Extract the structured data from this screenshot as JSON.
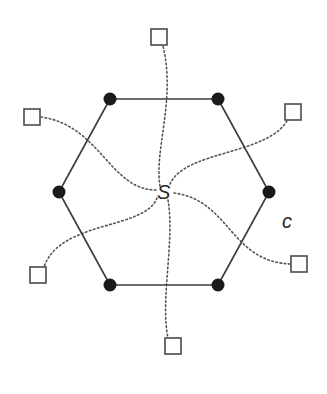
{
  "diagram": {
    "type": "hexagon-with-center-spokes",
    "center_label": "S",
    "region_label": "c",
    "center": {
      "x": 164,
      "y": 192
    },
    "colors": {
      "edge": "#3a3a3a",
      "vertex": "#1a1a1a",
      "terminal_stroke": "#4a4a4a",
      "spoke": "#555555",
      "background": "#ffffff"
    },
    "vertices": [
      {
        "id": "v-top-left",
        "x": 110,
        "y": 99
      },
      {
        "id": "v-top-right",
        "x": 218,
        "y": 99
      },
      {
        "id": "v-right",
        "x": 269,
        "y": 192
      },
      {
        "id": "v-bottom-right",
        "x": 218,
        "y": 285
      },
      {
        "id": "v-bottom-left",
        "x": 110,
        "y": 285
      },
      {
        "id": "v-left",
        "x": 59,
        "y": 192
      }
    ],
    "terminals": [
      {
        "id": "t-top",
        "x": 159,
        "y": 37,
        "size": 16
      },
      {
        "id": "t-upper-right",
        "x": 293,
        "y": 112,
        "size": 16
      },
      {
        "id": "t-lower-right",
        "x": 299,
        "y": 264,
        "size": 16
      },
      {
        "id": "t-bottom",
        "x": 173,
        "y": 346,
        "size": 16
      },
      {
        "id": "t-lower-left",
        "x": 38,
        "y": 275,
        "size": 16
      },
      {
        "id": "t-upper-left",
        "x": 32,
        "y": 117,
        "size": 16
      }
    ],
    "spokes": [
      {
        "to": "t-top",
        "path": "M160,186 C154,150 176,100 163,46"
      },
      {
        "to": "t-upper-right",
        "path": "M170,184 C185,150 270,155 288,119"
      },
      {
        "to": "t-lower-right",
        "path": "M174,193 C230,200 230,262 291,264"
      },
      {
        "to": "t-bottom",
        "path": "M168,200 C175,240 160,300 168,338"
      },
      {
        "to": "t-lower-left",
        "path": "M157,198 C145,230 60,220 44,267"
      },
      {
        "to": "t-upper-left",
        "path": "M156,190 C110,190 100,125 41,117"
      }
    ]
  }
}
